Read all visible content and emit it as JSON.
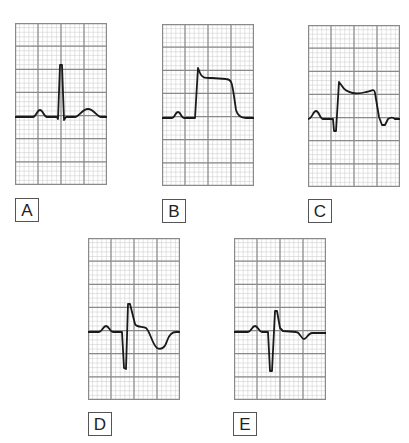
{
  "figure": {
    "grid": {
      "major_cols": 4,
      "major_rows": 7,
      "minor_per_major": 5,
      "major_color": "#8a8a8a",
      "minor_color": "#c8c8c8",
      "trace_color": "#1a1a1a"
    },
    "panels": [
      {
        "id": "A",
        "label": "A",
        "left": 15,
        "top": 23,
        "label_left": 15,
        "label_top": 198,
        "waveform": "normal P-QRS-T complex with tall upright R wave",
        "path": "M0,94 L18,94 C21,94 22,87 25,87 C28,87 29,94 32,94 L42,94 L43,96 L45,42 L47,42 L49,97 L51,94 L60,94 C64,94 67,86 73,86 C79,86 82,94 86,94 L92,94"
      },
      {
        "id": "B",
        "label": "B",
        "left": 162,
        "top": 24,
        "label_left": 162,
        "label_top": 199,
        "waveform": "ST elevation, tombstone/monophasic current-of-injury pattern",
        "path": "M0,94 L10,94 C13,94 13,88 16,88 C19,88 19,94 22,94 L33,94 L36,44 L38,49 C40,54 42,54 50,54 L64,55 C70,55 70,60 72,72 L74,86 C76,93 80,94 84,94 L92,94"
      },
      {
        "id": "C",
        "label": "C",
        "left": 308,
        "top": 25,
        "label_left": 308,
        "label_top": 199,
        "waveform": "ST elevation with small Q wave and terminal undershoot",
        "path": "M0,94 C4,94 5,86 8,86 C11,86 12,94 15,94 L25,94 L26,106 L28,106 L31,57 L34,61 C38,68 48,70 58,67 C64,66 66,63 67,68 L71,92 L74,100 L77,100 L80,94 C83,92 85,92 87,94 L92,94"
      },
      {
        "id": "D",
        "label": "D",
        "left": 88,
        "top": 238,
        "label_left": 88,
        "label_top": 412,
        "waveform": "deep S wave with ST depression and deep inverted T wave",
        "path": "M0,94 L11,94 C14,94 15,88 18,88 C21,88 22,94 25,94 L34,94 L36,130 L38,131 L40,66 L42,66 L47,86 C49,90 55,88 58,90 C62,93 64,106 69,110 C73,112 77,110 79,103 C81,97 84,94 88,94 L92,94"
      },
      {
        "id": "E",
        "label": "E",
        "left": 234,
        "top": 238,
        "label_left": 233,
        "label_top": 412,
        "waveform": "deep S wave with small terminal R and shallow inverted T wave",
        "path": "M0,94 L14,94 C17,94 18,88 21,88 C24,88 25,94 28,94 L34,94 L36,133 L38,133 L41,73 L43,73 L46,90 L49,93 L62,94 C66,94 67,101 70,101 C73,101 74,95 78,95 L92,95"
      }
    ]
  }
}
